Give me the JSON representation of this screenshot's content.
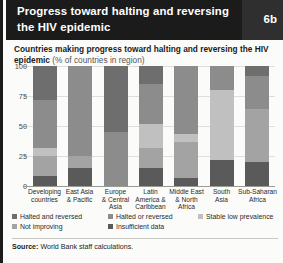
{
  "header": {
    "title": "Progress toward halting and reversing the HIV epidemic",
    "badge": "6b"
  },
  "subtitle": {
    "main": "Countries making progress toward halting and reversing the HIV epidemic",
    "unit": "(% of countries in region)"
  },
  "footer": {
    "source_label": "Source:",
    "source_text": "World Bank staff calculations."
  },
  "colors": {
    "halted_and_reversed": "#6e6e6e",
    "halted_or_reversed": "#8c8c8c",
    "stable_low_prevalence": "#c0c0c0",
    "not_improving": "#a3a3a3",
    "insufficient_data": "#5a5a5a",
    "header_bg": "#1b1b1b",
    "badge_bg": "#2f2f2f",
    "grid": "#dededa",
    "page_bg": "#fbfbfa"
  },
  "chart_data": {
    "type": "bar",
    "title": "Countries making progress toward halting and reversing the HIV epidemic",
    "subtitle": "(% of countries in region)",
    "stacked": true,
    "xlabel": "",
    "ylabel": "",
    "ylim": [
      0,
      100
    ],
    "yticks": [
      0,
      25,
      50,
      75,
      100
    ],
    "ytick_labels": [
      "0",
      "25",
      "50",
      "75",
      "100"
    ],
    "grid": true,
    "legend_position": "bottom",
    "categories": [
      "Developing countries",
      "East Asia & Pacific",
      "Europe & Central Asia",
      "Latin America & Caribbean",
      "Middle East & North Africa",
      "South Asia",
      "Sub-Saharan Africa"
    ],
    "series": [
      {
        "name": "Insufficient data",
        "color": "#5a5a5a",
        "values": [
          8,
          15,
          0,
          15,
          7,
          22,
          20
        ]
      },
      {
        "name": "Not improving",
        "color": "#a3a3a3",
        "values": [
          17,
          10,
          0,
          17,
          30,
          0,
          44
        ]
      },
      {
        "name": "Stable low prevalence",
        "color": "#c0c0c0",
        "values": [
          7,
          0,
          0,
          20,
          6,
          58,
          0
        ]
      },
      {
        "name": "Halted or reversed",
        "color": "#8c8c8c",
        "values": [
          40,
          75,
          45,
          33,
          57,
          20,
          28
        ]
      },
      {
        "name": "Halted and reversed",
        "color": "#6e6e6e",
        "values": [
          28,
          0,
          55,
          15,
          0,
          0,
          8
        ]
      }
    ]
  },
  "legend": [
    {
      "label": "Halted and reversed",
      "color": "#6e6e6e"
    },
    {
      "label": "Halted or reversed",
      "color": "#8c8c8c"
    },
    {
      "label": "Stable low prevalence",
      "color": "#c0c0c0"
    },
    {
      "label": "Not improving",
      "color": "#a3a3a3"
    },
    {
      "label": "Insufficient data",
      "color": "#5a5a5a"
    }
  ],
  "xlabel_lines": [
    [
      "Developing",
      "countries"
    ],
    [
      "East Asia",
      "& Pacific"
    ],
    [
      "Europe",
      "& Central",
      "Asia"
    ],
    [
      "Latin",
      "America &",
      "Caribbean"
    ],
    [
      "Middle East",
      "& North",
      "Africa"
    ],
    [
      "South",
      "Asia"
    ],
    [
      "Sub-Saharan",
      "Africa"
    ]
  ]
}
